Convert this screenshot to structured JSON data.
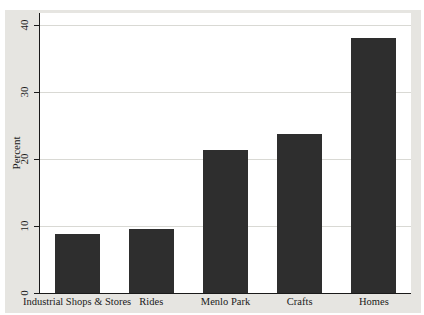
{
  "chart": {
    "colors": {
      "bar": "#2e2e2e",
      "outer_background": "#e6e5e1",
      "plot_background": "#ffffff",
      "gridline": "#d9d9d4",
      "axis": "#1a1a1a",
      "text": "#1a1a1a"
    }
  },
  "chart_data": {
    "type": "bar",
    "categories": [
      "Industrial Shops & Stores",
      "Rides",
      "Menlo Park",
      "Crafts",
      "Homes"
    ],
    "values": [
      8.8,
      9.5,
      21.4,
      23.8,
      38
    ],
    "title": "",
    "xlabel": "",
    "ylabel": "Percent",
    "yticks": [
      0,
      10,
      20,
      30,
      40
    ],
    "ylim": [
      0,
      41.8
    ],
    "grid": true,
    "legend": false,
    "bar_width_px": 45
  }
}
